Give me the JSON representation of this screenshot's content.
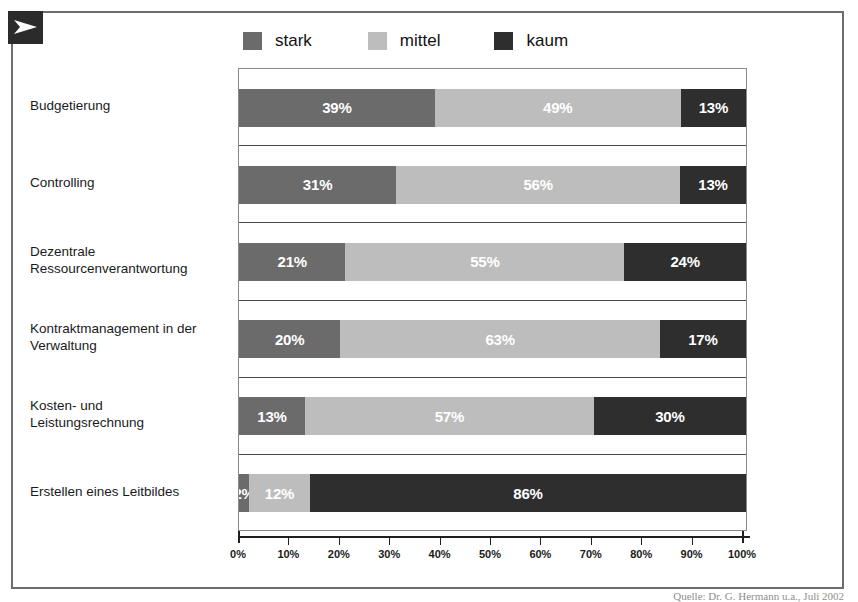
{
  "logo": {
    "icon": "arrow-right-icon",
    "background_color": "#2b2b2b",
    "arrow_color": "#ffffff"
  },
  "frame": {
    "border_color": "#6d6d6d",
    "background_color": "#ffffff"
  },
  "legend": {
    "position": "top",
    "entries": [
      {
        "label": "stark",
        "color": "#6b6b6b"
      },
      {
        "label": "mittel",
        "color": "#bdbdbd"
      },
      {
        "label": "kaum",
        "color": "#2e2e2e"
      }
    ]
  },
  "axis": {
    "tick_labels": [
      "0%",
      "10%",
      "20%",
      "30%",
      "40%",
      "50%",
      "60%",
      "70%",
      "80%",
      "90%",
      "100%"
    ],
    "tick_values": [
      0,
      10,
      20,
      30,
      40,
      50,
      60,
      70,
      80,
      90,
      100
    ],
    "min": 0,
    "max": 100
  },
  "source": {
    "text": "Quelle: Dr. G. Hermann u.a., Juli 2002"
  },
  "chart_data": {
    "type": "bar",
    "orientation": "horizontal",
    "stacked": true,
    "normalized_percent": true,
    "title": "",
    "subtitle": "",
    "xlabel": "",
    "ylabel": "",
    "xlim": [
      0,
      100
    ],
    "grid": false,
    "legend_position": "top",
    "categories": [
      "Budgetierung",
      "Controlling",
      "Dezentrale Ressourcenverantwortung",
      "Kontraktmanagement in der Verwaltung",
      "Kosten- und Leistungsrechnung",
      "Erstellen eines Leitbildes"
    ],
    "series": [
      {
        "name": "stark",
        "color": "#6b6b6b",
        "values": [
          39,
          31,
          21,
          20,
          13,
          2
        ]
      },
      {
        "name": "mittel",
        "color": "#bdbdbd",
        "values": [
          49,
          56,
          55,
          63,
          57,
          12
        ]
      },
      {
        "name": "kaum",
        "color": "#2e2e2e",
        "values": [
          13,
          13,
          24,
          17,
          30,
          86
        ]
      }
    ],
    "data_labels": [
      [
        "39%",
        "49%",
        "13%"
      ],
      [
        "31%",
        "56%",
        "13%"
      ],
      [
        "21%",
        "55%",
        "24%"
      ],
      [
        "20%",
        "63%",
        "17%"
      ],
      [
        "13%",
        "57%",
        "30%"
      ],
      [
        "2%",
        "12%",
        "86%"
      ]
    ]
  },
  "rows": [
    {
      "label_lines": [
        "Budgetierung"
      ]
    },
    {
      "label_lines": [
        "Controlling"
      ]
    },
    {
      "label_lines": [
        "Dezentrale",
        "Ressourcenverantwortung"
      ]
    },
    {
      "label_lines": [
        "Kontraktmanagement in der",
        "Verwaltung"
      ]
    },
    {
      "label_lines": [
        "Kosten- und",
        "Leistungsrechnung"
      ]
    },
    {
      "label_lines": [
        "Erstellen eines Leitbildes"
      ]
    }
  ]
}
